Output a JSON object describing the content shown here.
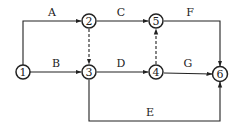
{
  "diagram": {
    "type": "activity-on-arrow network",
    "nodes": [
      {
        "id": "1",
        "label": "1",
        "x": 23,
        "y": 72
      },
      {
        "id": "2",
        "label": "2",
        "x": 89,
        "y": 21
      },
      {
        "id": "3",
        "label": "3",
        "x": 89,
        "y": 72
      },
      {
        "id": "4",
        "label": "4",
        "x": 156,
        "y": 72
      },
      {
        "id": "5",
        "label": "5",
        "x": 156,
        "y": 21
      },
      {
        "id": "6",
        "label": "6",
        "x": 220,
        "y": 74
      }
    ],
    "activities": [
      {
        "label": "A",
        "from": "1",
        "to": "2",
        "style": "solid"
      },
      {
        "label": "B",
        "from": "1",
        "to": "3",
        "style": "solid"
      },
      {
        "label": "C",
        "from": "2",
        "to": "5",
        "style": "solid"
      },
      {
        "label": "D",
        "from": "3",
        "to": "4",
        "style": "solid"
      },
      {
        "label": "E",
        "from": "3",
        "to": "6",
        "style": "solid"
      },
      {
        "label": "F",
        "from": "5",
        "to": "6",
        "style": "solid"
      },
      {
        "label": "G",
        "from": "4",
        "to": "6",
        "style": "solid"
      },
      {
        "label": "",
        "from": "2",
        "to": "3",
        "style": "dashed",
        "dummy": true
      },
      {
        "label": "",
        "from": "4",
        "to": "5",
        "style": "dashed",
        "dummy": true
      }
    ]
  }
}
